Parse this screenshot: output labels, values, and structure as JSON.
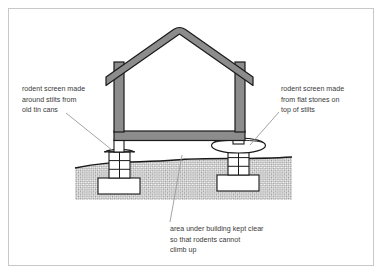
{
  "figure": {
    "border_color": "#c8c8c8",
    "background": "#ffffff"
  },
  "colors": {
    "structure_fill": "#8c8c8c",
    "structure_stroke": "#1a1a1a",
    "interior_fill": "#ffffff",
    "ground_hatch": "#9a9a9a",
    "ground_line": "#1a1a1a",
    "pier_fill": "#ffffff",
    "pier_stroke": "#1a1a1a",
    "footing_fill": "#ffffff",
    "stone_fill": "#ffffff",
    "leader_line": "#9a9a9a",
    "text": "#3a3a3a"
  },
  "labels": {
    "left": {
      "name": "tin-can-screen-label",
      "lines": [
        "rodent screen made",
        "around stilts from",
        "old tin cans"
      ],
      "x": 22,
      "y": 88
    },
    "right": {
      "name": "flat-stone-screen-label",
      "lines": [
        "rodent screen made",
        "from flat stones on",
        "top of stilts"
      ],
      "x": 281,
      "y": 88
    },
    "bottom": {
      "name": "clear-underfloor-label",
      "lines": [
        "area under building kept clear",
        "so that rodents cannot",
        "climb up"
      ],
      "x": 170,
      "y": 231
    }
  },
  "parts": {
    "roof": "gabled-roof",
    "walls": "wall-panels",
    "floor": "floor-band",
    "left_pier": "masonry-pier-left",
    "right_pier": "masonry-pier-right",
    "left_screen": "tin-can-rodent-screen",
    "right_screen": "flat-stone-rodent-screen",
    "left_footing": "concrete-footing-left",
    "right_footing": "concrete-footing-right",
    "ground": "hatched-ground"
  }
}
